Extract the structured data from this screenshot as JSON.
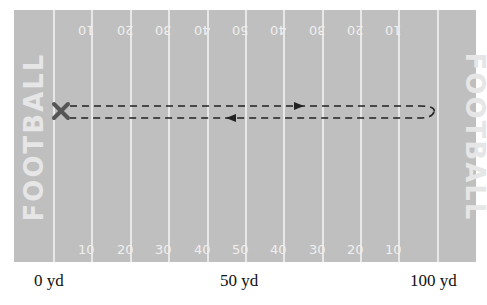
{
  "field": {
    "endzone_text_left": "FOOTBALL",
    "endzone_text_right": "FOOTBALL",
    "top_numbers": [
      "10",
      "20",
      "30",
      "40",
      "50",
      "40",
      "30",
      "20",
      "10"
    ],
    "bottom_numbers": [
      "10",
      "20",
      "30",
      "40",
      "50",
      "40",
      "30",
      "20",
      "10"
    ],
    "colors": {
      "turf": "#bfbfbf",
      "lines": "#e8e8e8",
      "marker": "#555555",
      "path": "#222222"
    }
  },
  "play": {
    "start_marker": "X",
    "path": "dashed out-and-back route from 0 yd to near 100 yd and back"
  },
  "axis": {
    "labels": [
      "0 yd",
      "50 yd",
      "100 yd"
    ]
  }
}
